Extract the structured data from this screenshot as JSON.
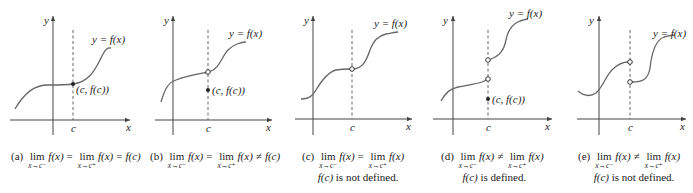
{
  "panels": [
    {
      "id": "a",
      "tag": "(a)",
      "curve_label": "y = f(x)",
      "point_label": "(c, f(c))",
      "axis_x": "x",
      "axis_y": "y",
      "c_label": "c",
      "caption": {
        "lim1": "lim",
        "sub1": "x→c⁻",
        "expr1": "f(x)",
        "op1": "=",
        "lim2": "lim",
        "sub2": "x→c⁺",
        "expr2": "f(x)",
        "op2": "=",
        "tail": "f(c)",
        "line2": ""
      }
    },
    {
      "id": "b",
      "tag": "(b)",
      "curve_label": "y = f(x)",
      "point_label": "(c, f(c))",
      "axis_x": "x",
      "axis_y": "y",
      "c_label": "c",
      "caption": {
        "lim1": "lim",
        "sub1": "x→c⁻",
        "expr1": "f(x)",
        "op1": "=",
        "lim2": "lim",
        "sub2": "x→c⁺",
        "expr2": "f(x)",
        "op2": "≠",
        "tail": "f(c)",
        "line2": ""
      }
    },
    {
      "id": "c",
      "tag": "(c)",
      "curve_label": "y = f(x)",
      "axis_x": "x",
      "axis_y": "y",
      "c_label": "c",
      "caption": {
        "lim1": "lim",
        "sub1": "x→c⁻",
        "expr1": "f(x)",
        "op1": "=",
        "lim2": "lim",
        "sub2": "x→c⁺",
        "expr2": "f(x)",
        "op2": "",
        "tail": "",
        "line2_fc": "f(c)",
        "line2": " is not defined."
      }
    },
    {
      "id": "d",
      "tag": "(d)",
      "curve_label": "y = f(x)",
      "point_label": "(c, f(c))",
      "axis_x": "x",
      "axis_y": "y",
      "c_label": "c",
      "caption": {
        "lim1": "lim",
        "sub1": "x→c⁻",
        "expr1": "f(x)",
        "op1": "≠",
        "lim2": "lim",
        "sub2": "x→c⁺",
        "expr2": "f(x)",
        "op2": "",
        "tail": "",
        "line2_fc": "f(c)",
        "line2": " is defined."
      }
    },
    {
      "id": "e",
      "tag": "(e)",
      "curve_label": "y = f(x)",
      "axis_x": "x",
      "axis_y": "y",
      "c_label": "c",
      "caption": {
        "lim1": "lim",
        "sub1": "x→c⁻",
        "expr1": "f(x)",
        "op1": "≠",
        "lim2": "lim",
        "sub2": "x→c⁺",
        "expr2": "f(x)",
        "op2": "",
        "tail": "",
        "line2_fc": "f(c)",
        "line2": " is not defined."
      }
    }
  ],
  "colors": {
    "curve": "#666666",
    "axis": "#444444",
    "text": "#222222",
    "background": "#ffffff"
  }
}
